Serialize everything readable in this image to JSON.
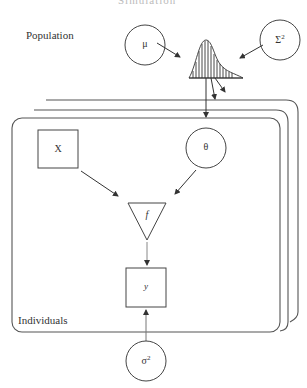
{
  "title_fragment": "Simulation",
  "labels": {
    "population": "Population",
    "individuals": "Individuals"
  },
  "nodes": {
    "mu": "μ",
    "Sigma": "Σ",
    "Sigma_sup": "2",
    "x": "X",
    "theta": "θ",
    "f": "f",
    "y": "y",
    "sigma": "σ",
    "sigma_sup": "2"
  },
  "colors": {
    "stroke": "#333333",
    "background": "#ffffff"
  }
}
